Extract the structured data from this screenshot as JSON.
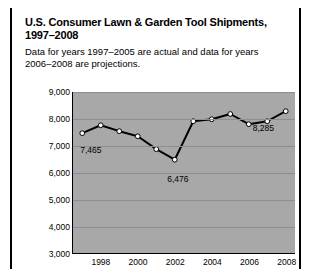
{
  "title": "U.S. Consumer Lawn & Garden Tool Shipments, 1997–2008",
  "subtitle": "Data for years 1997–2005 are actual and data for years 2006–2008 are projections.",
  "chart_data": {
    "type": "line",
    "title": "U.S. Consumer Lawn & Garden Tool Shipments, 1997–2008",
    "xlabel": "",
    "ylabel": "Million dollars",
    "ylim": [
      3000,
      9000
    ],
    "ytick_labels": [
      "9,000",
      "8,000",
      "7,000",
      "6,000",
      "5,000",
      "4,000",
      "3,000"
    ],
    "ytick_values": [
      9000,
      8000,
      7000,
      6000,
      5000,
      4000,
      3000
    ],
    "xtick_labels": [
      "1998",
      "2000",
      "2002",
      "2004",
      "2006",
      "2008"
    ],
    "xtick_values": [
      1998,
      2000,
      2002,
      2004,
      2006,
      2008
    ],
    "x": [
      1997,
      1998,
      1999,
      2000,
      2001,
      2002,
      2003,
      2004,
      2005,
      2006,
      2007,
      2008
    ],
    "values": [
      7465,
      7760,
      7540,
      7350,
      6870,
      6476,
      7910,
      7985,
      8180,
      7800,
      7910,
      8285
    ],
    "point_labels": [
      {
        "x": 1997,
        "value": 7465,
        "text": "7,465"
      },
      {
        "x": 2002,
        "value": 6476,
        "text": "6,476"
      },
      {
        "x": 2008,
        "value": 8285,
        "text": "8,285"
      }
    ],
    "grid": true,
    "legend": "none",
    "plot_background": "#a8a8a8",
    "line_color": "#000000",
    "marker_color": "#ffffff"
  }
}
